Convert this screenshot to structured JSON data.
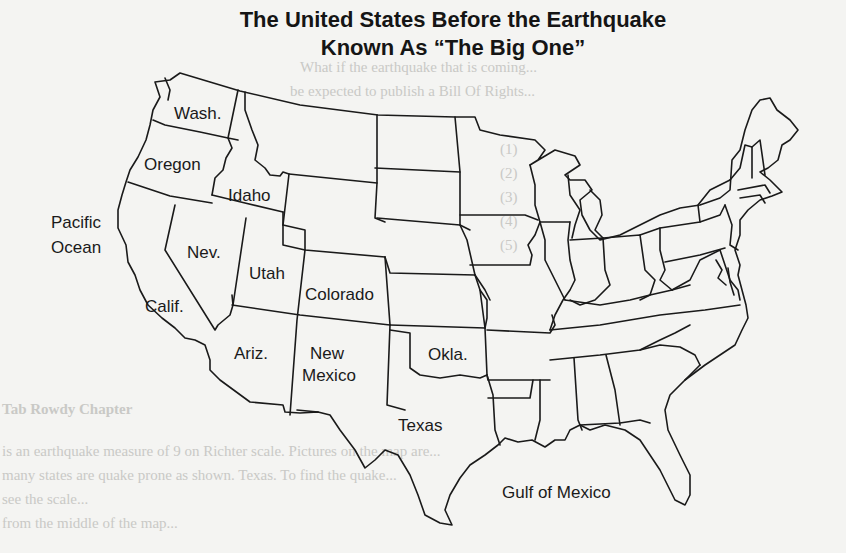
{
  "title": {
    "line1": "The United States Before the Earthquake",
    "line2": "Known As “The Big One”"
  },
  "map": {
    "line_color": "#1a1a1a",
    "background": "#f4f4f2",
    "labels": {
      "wash": "Wash.",
      "oregon": "Oregon",
      "idaho": "Idaho",
      "pacific_line1": "Pacific",
      "pacific_line2": "Ocean",
      "nev": "Nev.",
      "utah": "Utah",
      "colorado": "Colorado",
      "calif": "Calif.",
      "ariz": "Ariz.",
      "new_mexico_line1": "New",
      "new_mexico_line2": "Mexico",
      "okla": "Okla.",
      "texas": "Texas",
      "gulf": "Gulf of Mexico"
    }
  },
  "bleed_through": {
    "lines": [
      "What if the earthquake that is coming...",
      "be expected to publish a Bill Of Rights...",
      "(1)",
      "(2)",
      "(3)",
      "(4)",
      "(5)",
      "Tab Rowdy Chapter",
      "is an earthquake measure of 9 on Richter scale. Pictures on the map are...",
      "many states are quake prone as shown. Texas. To find the quake...",
      "see the scale...",
      "from the middle of the map..."
    ]
  }
}
